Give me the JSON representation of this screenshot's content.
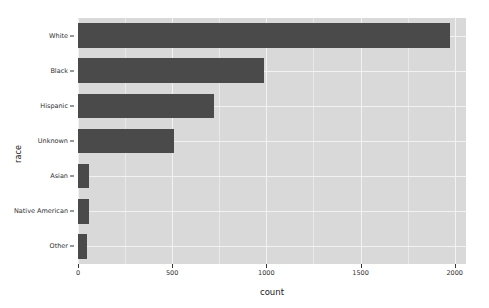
{
  "chart_data": {
    "type": "bar",
    "orientation": "horizontal",
    "title": "",
    "xlabel": "count",
    "ylabel": "race",
    "categories": [
      "White",
      "Black",
      "Hispanic",
      "Unknown",
      "Asian",
      "Native American",
      "Other"
    ],
    "values": [
      1975,
      990,
      720,
      512,
      57,
      57,
      48
    ],
    "xlim": [
      0,
      2060
    ],
    "ylim": [
      0,
      7
    ],
    "xticks": [
      0,
      500,
      1000,
      1500,
      2000
    ],
    "xticklabels": [
      "0",
      "500",
      "1000",
      "1500",
      "2000"
    ],
    "yticklabels": [
      "White",
      "Black",
      "Hispanic",
      "Unknown",
      "Asian",
      "Native American",
      "Other"
    ],
    "grid": true,
    "legend": false,
    "legend_position": "none",
    "colors": {
      "bar": "#4a4a4a",
      "panel_background": "#d9d9d9",
      "gridline_major": "#f2f2f2",
      "gridline_minor": "#e9e9e9",
      "page_background": "#ffffff",
      "text": "#303030"
    }
  }
}
